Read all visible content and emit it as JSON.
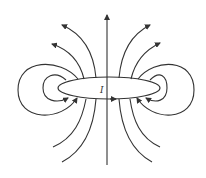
{
  "diagram": {
    "current_label": "I",
    "colors": {
      "line": "#333333",
      "background": "#ffffff"
    }
  }
}
